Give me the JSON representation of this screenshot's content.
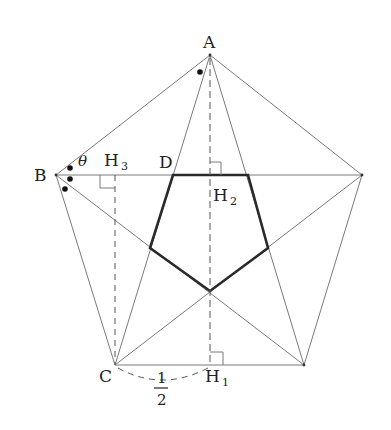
{
  "diagram": {
    "type": "regular-pentagon-construction",
    "labels": {
      "A": "A",
      "B": "B",
      "C": "C",
      "D": "D",
      "H1": "H",
      "H1_sub": "1",
      "H2": "H",
      "H2_sub": "2",
      "H3": "H",
      "H3_sub": "3",
      "theta": "θ",
      "half_num": "1",
      "half_den": "2"
    },
    "outer_pentagon_vertices": [
      {
        "name": "A",
        "x": 210,
        "y": 55
      },
      {
        "name": "E",
        "x": 362,
        "y": 175
      },
      {
        "name": "D'",
        "x": 304,
        "y": 365
      },
      {
        "name": "C",
        "x": 115,
        "y": 365
      },
      {
        "name": "B",
        "x": 56,
        "y": 175
      }
    ],
    "inner_pentagon_vertices": [
      {
        "x": 173,
        "y": 175
      },
      {
        "x": 248,
        "y": 175
      },
      {
        "x": 268,
        "y": 248
      },
      {
        "x": 210,
        "y": 291
      },
      {
        "x": 150,
        "y": 248
      }
    ],
    "angle_marks": {
      "A": 1,
      "B": 3
    },
    "annotations": [
      "right angle at H1",
      "right angle at H2",
      "right angle at H3",
      "CH1 = 1/2"
    ]
  }
}
